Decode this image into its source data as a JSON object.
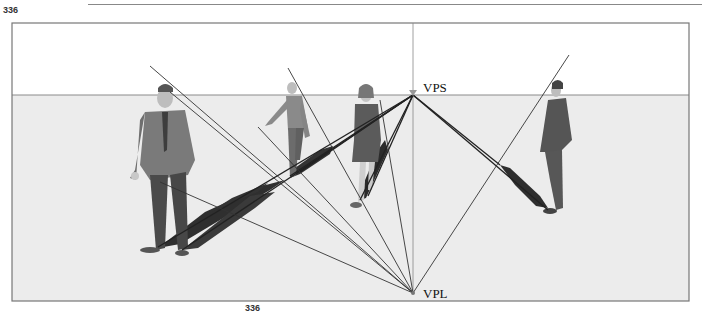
{
  "figure_numbers": {
    "top": "336",
    "bottom": "336"
  },
  "vanishing_points": {
    "sun": {
      "label": "VPS"
    },
    "light": {
      "label": "VPL"
    }
  },
  "colors": {
    "sky": "#ffffff",
    "ground": "#ececec",
    "frame": "#777777",
    "lines": "#3a3a3a",
    "shadow": "#2e2e2e",
    "figure_suit": "#6e6e6e",
    "figure_pants": "#4a4a4a",
    "figure_skin": "#cfcfcf"
  },
  "figures": [
    {
      "name": "man-in-suit-left",
      "description": "Man in suit standing"
    },
    {
      "name": "man-walking",
      "description": "Man in sweater walking"
    },
    {
      "name": "woman-in-dress",
      "description": "Woman in dress walking"
    },
    {
      "name": "man-in-suit-right",
      "description": "Man in suit, hand on hip, profile"
    }
  ]
}
